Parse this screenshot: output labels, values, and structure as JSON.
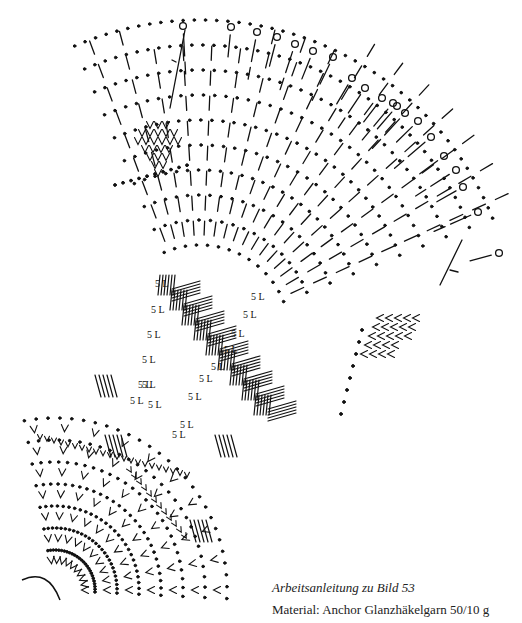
{
  "caption": {
    "title": "Arbeitsanleitung zu Bild 53",
    "material": "Material: Anchor Glanzhäkelgarn 50/10 g"
  },
  "diagram": {
    "ink_color": "#111111",
    "chain_label": "5 L",
    "chain_labels": [
      {
        "x": 155,
        "y": 287
      },
      {
        "x": 151,
        "y": 313
      },
      {
        "x": 147,
        "y": 338
      },
      {
        "x": 142,
        "y": 363
      },
      {
        "x": 142,
        "y": 388
      },
      {
        "x": 148,
        "y": 408
      },
      {
        "x": 138,
        "y": 388
      },
      {
        "x": 251,
        "y": 300
      },
      {
        "x": 243,
        "y": 318
      },
      {
        "x": 231,
        "y": 337
      },
      {
        "x": 224,
        "y": 353
      },
      {
        "x": 211,
        "y": 370
      },
      {
        "x": 199,
        "y": 382
      },
      {
        "x": 188,
        "y": 400
      },
      {
        "x": 180,
        "y": 428
      },
      {
        "x": 130,
        "y": 404
      },
      {
        "x": 172,
        "y": 438
      }
    ],
    "circles": [
      {
        "x": 183,
        "y": 26
      },
      {
        "x": 231,
        "y": 27
      },
      {
        "x": 257,
        "y": 32
      },
      {
        "x": 277,
        "y": 37
      },
      {
        "x": 295,
        "y": 44
      },
      {
        "x": 313,
        "y": 51
      },
      {
        "x": 333,
        "y": 57
      },
      {
        "x": 352,
        "y": 78
      },
      {
        "x": 365,
        "y": 88
      },
      {
        "x": 382,
        "y": 98
      },
      {
        "x": 393,
        "y": 103
      },
      {
        "x": 397,
        "y": 106
      },
      {
        "x": 405,
        "y": 113
      },
      {
        "x": 418,
        "y": 121
      },
      {
        "x": 431,
        "y": 137
      },
      {
        "x": 444,
        "y": 156
      },
      {
        "x": 456,
        "y": 170
      },
      {
        "x": 463,
        "y": 187
      },
      {
        "x": 478,
        "y": 212
      },
      {
        "x": 499,
        "y": 253
      }
    ]
  }
}
